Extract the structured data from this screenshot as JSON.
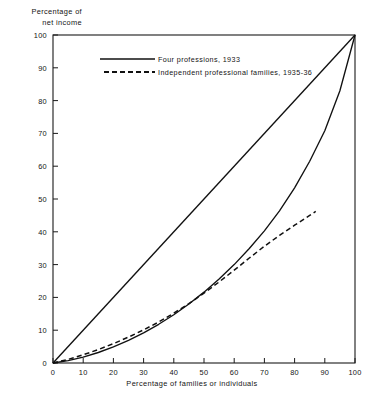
{
  "chart_data": {
    "type": "line",
    "title": "",
    "xlabel": "Percentage of families or individuals",
    "ylabel": "Percentage of\nnet income",
    "ylabel_line1": "Percentage of",
    "ylabel_line2": "net income",
    "xlim": [
      0,
      100
    ],
    "ylim": [
      0,
      100
    ],
    "grid": false,
    "legend_position": "upper-center",
    "xticks": [
      "0",
      "10",
      "20",
      "30",
      "40",
      "50",
      "60",
      "70",
      "80",
      "90",
      "100"
    ],
    "yticks": [
      "0",
      "10",
      "20",
      "30",
      "40",
      "50",
      "60",
      "70",
      "80",
      "90",
      "100"
    ],
    "xtick_values": [
      0,
      10,
      20,
      30,
      40,
      50,
      60,
      70,
      80,
      90,
      100
    ],
    "ytick_values": [
      0,
      10,
      20,
      30,
      40,
      50,
      60,
      70,
      80,
      90,
      100
    ],
    "series": [
      {
        "name": "line-of-equality",
        "style": "solid",
        "color": "#111111",
        "in_legend": false,
        "x": [
          0,
          100
        ],
        "y": [
          0,
          100
        ]
      },
      {
        "name": "Four professions, 1933",
        "style": "solid",
        "color": "#111111",
        "in_legend": true,
        "x": [
          0,
          5,
          10,
          15,
          20,
          25,
          30,
          35,
          40,
          45,
          50,
          55,
          60,
          65,
          70,
          75,
          80,
          85,
          90,
          95,
          100
        ],
        "y": [
          0,
          0.7,
          1.8,
          3.2,
          4.9,
          6.9,
          9.2,
          11.8,
          14.7,
          18.0,
          21.6,
          25.6,
          30.0,
          34.9,
          40.3,
          46.4,
          53.4,
          61.5,
          70.8,
          83.0,
          100
        ]
      },
      {
        "name": "Independent professional families, 1935-36",
        "style": "dashed",
        "color": "#111111",
        "in_legend": true,
        "x": [
          0,
          5,
          10,
          15,
          20,
          25,
          30,
          35,
          40,
          45,
          50,
          55,
          60,
          65,
          70,
          75,
          80,
          85,
          87
        ],
        "y": [
          0,
          1.1,
          2.5,
          4.1,
          5.9,
          7.9,
          10.1,
          12.5,
          15.2,
          18.1,
          21.3,
          24.7,
          28.3,
          32.0,
          35.6,
          38.9,
          42.0,
          45.0,
          46.2
        ]
      }
    ],
    "legend": [
      {
        "label": "Four professions, 1933",
        "style": "solid"
      },
      {
        "label": "Independent professional families, 1935-36",
        "style": "dashed"
      }
    ]
  }
}
